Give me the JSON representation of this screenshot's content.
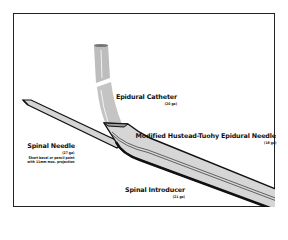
{
  "diagram": {
    "type": "medical-device-illustration",
    "colors": {
      "outline": "#111111",
      "fill": "#cfcfcf",
      "fill_light": "#e2e2e2",
      "background": "#ffffff"
    },
    "labels": {
      "epidural_catheter": {
        "title": "Epidural Catheter",
        "gauge": "(20 ga)"
      },
      "epidural_needle": {
        "title": "Modified Hustead-Tuohy Epidural Needle",
        "gauge": "(18 ga)"
      },
      "spinal_needle": {
        "title": "Spinal Needle",
        "gauge": "(27 ga)",
        "note_line1": "Short bevel or pencil point",
        "note_line2": "with 11mm max. projection"
      },
      "spinal_introducer": {
        "title": "Spinal Introducer",
        "gauge": "(21 ga)"
      }
    }
  }
}
